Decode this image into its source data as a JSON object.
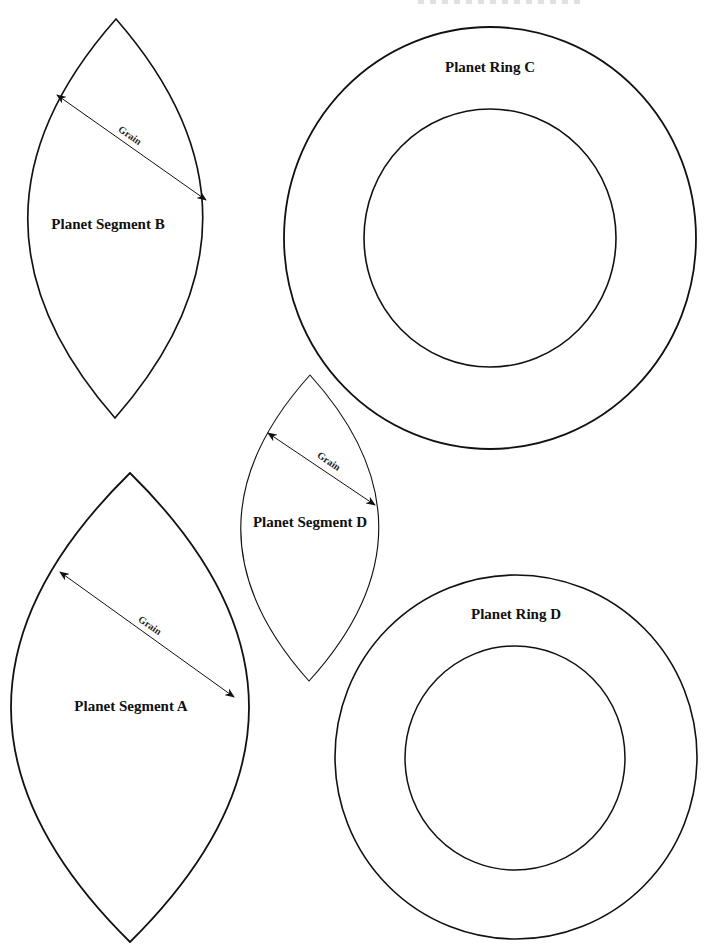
{
  "document": {
    "type": "pattern-sheet",
    "background": "#ffffff",
    "stroke_color": "#111111"
  },
  "pieces": {
    "segment_b": {
      "label": "Planet Segment B",
      "grain_label": "Grain"
    },
    "ring_c": {
      "label": "Planet Ring C"
    },
    "segment_d": {
      "label": "Planet Segment D",
      "grain_label": "Grain"
    },
    "segment_a": {
      "label": "Planet Segment A",
      "grain_label": "Grain"
    },
    "ring_d": {
      "label": "Planet Ring D"
    }
  }
}
